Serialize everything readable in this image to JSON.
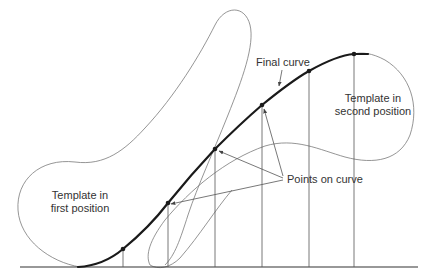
{
  "figure": {
    "labels": {
      "final_curve": "Final curve",
      "second_position_line1": "Template in",
      "second_position_line2": "second position",
      "first_position_line1": "Template in",
      "first_position_line2": "first position",
      "points_on_curve": "Points on curve"
    },
    "points_on_curve": [
      {
        "x": 123,
        "y": 249
      },
      {
        "x": 168,
        "y": 203
      },
      {
        "x": 215,
        "y": 149
      },
      {
        "x": 262,
        "y": 105
      },
      {
        "x": 309,
        "y": 71
      },
      {
        "x": 354,
        "y": 54
      }
    ],
    "baseline": {
      "x1": 20,
      "x2": 418,
      "y": 267
    },
    "colors": {
      "curve": "#1a1a1a",
      "template_outline": "#7a7a7a",
      "guide_lines": "#555555",
      "text": "#333333",
      "background": "#ffffff"
    }
  }
}
